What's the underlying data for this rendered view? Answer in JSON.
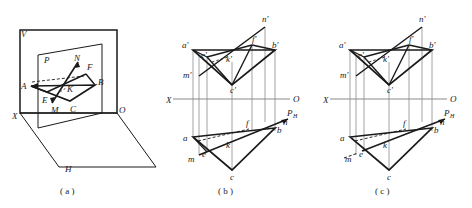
{
  "figure": {
    "background": "#ffffff",
    "ink": "#1a1a1a",
    "thin_ink": "#8a8a8a"
  },
  "panels": [
    {
      "id": "a",
      "caption": "( a )",
      "type": "pictorial-3d",
      "labels": [
        {
          "name": "plane-v-label",
          "text": "V",
          "x": 21,
          "y": 37
        },
        {
          "name": "plane-h-label",
          "text": "H",
          "x": 65,
          "y": 172
        },
        {
          "name": "plane-p-label",
          "text": "P",
          "x": 44,
          "y": 63
        },
        {
          "name": "axis-x-label",
          "text": "X",
          "x": 12,
          "y": 119
        },
        {
          "name": "axis-o-label",
          "text": "O",
          "x": 119,
          "y": 113
        },
        {
          "name": "point-a-label",
          "text": "A",
          "x": 21,
          "y": 84
        },
        {
          "name": "point-b-label",
          "text": "B",
          "x": 98,
          "y": 81
        },
        {
          "name": "point-c-label",
          "text": "C",
          "x": 72,
          "y": 105
        },
        {
          "name": "point-e-label",
          "text": "E",
          "x": 44,
          "y": 97
        },
        {
          "name": "point-f-label",
          "text": "F",
          "x": 89,
          "y": 64
        },
        {
          "name": "point-k-label",
          "text": "K",
          "x": 70,
          "y": 85
        },
        {
          "name": "point-m-label",
          "text": "M",
          "x": 54,
          "y": 107
        },
        {
          "name": "point-n-label",
          "text": "N",
          "x": 77,
          "y": 56
        }
      ]
    },
    {
      "id": "b",
      "caption": "( b )",
      "type": "orthographic-projection",
      "labels": [
        {
          "name": "axis-x-label",
          "text": "X",
          "x": 166,
          "y": 102
        },
        {
          "name": "axis-o-label",
          "text": "O",
          "x": 293,
          "y": 100
        },
        {
          "name": "point-a-prime-label",
          "text": "a'",
          "x": 186,
          "y": 44
        },
        {
          "name": "point-b-prime-label",
          "text": "b'",
          "x": 270,
          "y": 45
        },
        {
          "name": "point-c-prime-label",
          "text": "c'",
          "x": 231,
          "y": 88
        },
        {
          "name": "point-e-prime-label",
          "text": "e'",
          "x": 202,
          "y": 57
        },
        {
          "name": "point-f-prime-label",
          "text": "f'",
          "x": 256,
          "y": 40
        },
        {
          "name": "point-k-prime-label",
          "text": "k'",
          "x": 227,
          "y": 59
        },
        {
          "name": "point-m-prime-label",
          "text": "m'",
          "x": 188,
          "y": 74
        },
        {
          "name": "point-n-prime-label",
          "text": "n'",
          "x": 262,
          "y": 17
        },
        {
          "name": "point-a-label",
          "text": "a",
          "x": 184,
          "y": 135
        },
        {
          "name": "point-b-label",
          "text": "b",
          "x": 273,
          "y": 131
        },
        {
          "name": "point-c-label",
          "text": "c",
          "x": 233,
          "y": 176
        },
        {
          "name": "point-e-label",
          "text": "e",
          "x": 201,
          "y": 155
        },
        {
          "name": "point-f-label",
          "text": "f",
          "x": 246,
          "y": 124
        },
        {
          "name": "point-k-label",
          "text": "k",
          "x": 228,
          "y": 146
        },
        {
          "name": "point-m-label",
          "text": "m",
          "x": 190,
          "y": 159
        },
        {
          "name": "point-n-label",
          "text": "n",
          "x": 284,
          "y": 122
        },
        {
          "name": "trace-ph-label",
          "text": "P",
          "x": 287,
          "y": 113,
          "sub": "H"
        }
      ]
    },
    {
      "id": "c",
      "caption": "( c )",
      "type": "orthographic-projection",
      "labels": [
        {
          "name": "axis-x-label",
          "text": "X",
          "x": 323,
          "y": 102
        },
        {
          "name": "axis-o-label",
          "text": "O",
          "x": 450,
          "y": 100
        },
        {
          "name": "point-a-prime-label",
          "text": "a'",
          "x": 343,
          "y": 44
        },
        {
          "name": "point-b-prime-label",
          "text": "b'",
          "x": 427,
          "y": 45
        },
        {
          "name": "point-c-prime-label",
          "text": "c'",
          "x": 388,
          "y": 88
        },
        {
          "name": "point-e-prime-label",
          "text": "e'",
          "x": 359,
          "y": 57
        },
        {
          "name": "point-f-prime-label",
          "text": "f'",
          "x": 413,
          "y": 40
        },
        {
          "name": "point-k-prime-label",
          "text": "k'",
          "x": 384,
          "y": 59
        },
        {
          "name": "point-m-prime-label",
          "text": "m'",
          "x": 345,
          "y": 74
        },
        {
          "name": "point-n-prime-label",
          "text": "n'",
          "x": 419,
          "y": 17
        },
        {
          "name": "point-a-label",
          "text": "a",
          "x": 341,
          "y": 135
        },
        {
          "name": "point-b-label",
          "text": "b",
          "x": 430,
          "y": 131
        },
        {
          "name": "point-c-label",
          "text": "c",
          "x": 390,
          "y": 176
        },
        {
          "name": "point-e-label",
          "text": "e",
          "x": 358,
          "y": 155
        },
        {
          "name": "point-f-label",
          "text": "f",
          "x": 403,
          "y": 124
        },
        {
          "name": "point-k-label",
          "text": "k",
          "x": 385,
          "y": 146
        },
        {
          "name": "point-m-label",
          "text": "m",
          "x": 347,
          "y": 159
        },
        {
          "name": "point-n-label",
          "text": "n",
          "x": 441,
          "y": 122
        },
        {
          "name": "trace-ph-label",
          "text": "P",
          "x": 444,
          "y": 113,
          "sub": "H"
        }
      ]
    }
  ],
  "captions": {
    "a": "( a )",
    "b": "( b )",
    "c": "( c )"
  }
}
